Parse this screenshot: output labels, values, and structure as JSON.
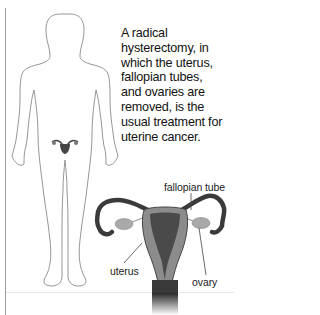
{
  "caption": {
    "lines": [
      "A radical",
      "hysterectomy, in",
      "which the uterus,",
      "fallopian tubes,",
      "and ovaries are",
      "removed, is the",
      "usual treatment for",
      "uterine cancer."
    ]
  },
  "labels": {
    "fallopian_tube": "fallopian tube",
    "uterus": "uterus",
    "ovary": "ovary"
  },
  "colors": {
    "outline": "#8a8a8a",
    "organ_dark": "#3a3a3a",
    "organ_mid": "#8c8c8c",
    "organ_light": "#b8b8b8",
    "text": "#111111"
  }
}
